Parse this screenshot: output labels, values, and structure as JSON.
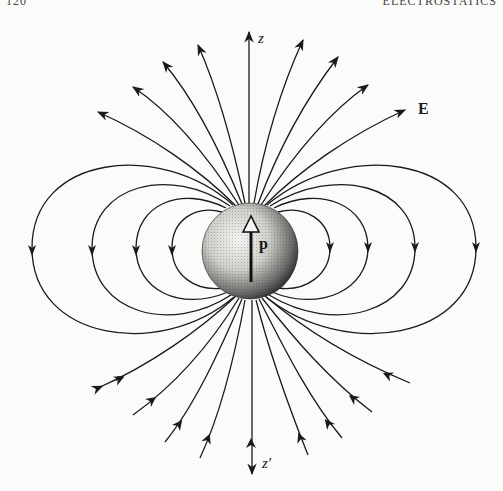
{
  "header": {
    "page_number": "120",
    "running_title": "ELECTROSTATICS"
  },
  "figure": {
    "labels": {
      "z_axis_top": "z",
      "z_axis_bottom": "z′",
      "field": "E",
      "dipole_moment": "p"
    },
    "sphere": {
      "cx": 250,
      "cy": 251,
      "r": 48
    },
    "colors": {
      "ink": "#1a1a1a",
      "paper": "#fbfbf9"
    },
    "top_field_line_count": 9,
    "bottom_field_line_count": 9,
    "loops_per_side": 4
  }
}
